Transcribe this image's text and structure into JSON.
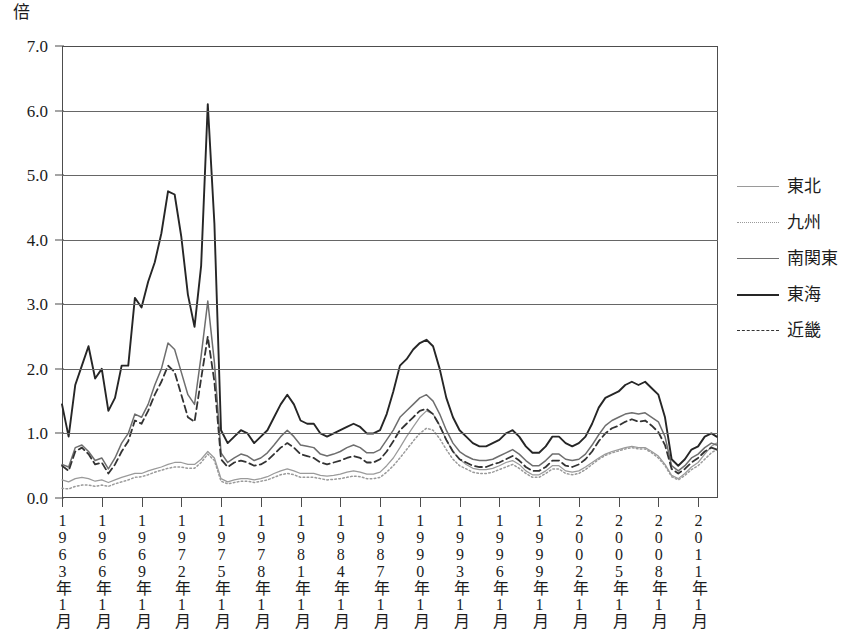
{
  "unit_label": "倍",
  "axes": {
    "y_ticks": [
      "7.0",
      "6.0",
      "5.0",
      "4.0",
      "3.0",
      "2.0",
      "1.0",
      "0.0"
    ],
    "x_ticks": [
      "1963年1月",
      "1966年1月",
      "1969年1月",
      "1972年1月",
      "1975年1月",
      "1978年1月",
      "1981年1月",
      "1984年1月",
      "1987年1月",
      "1990年1月",
      "1993年1月",
      "1996年1月",
      "1999年1月",
      "2002年1月",
      "2005年1月",
      "2008年1月",
      "2011年1月"
    ]
  },
  "legend": {
    "items": [
      {
        "label": "東北",
        "key": "tohoku",
        "style": "thin-solid-gray",
        "color": "#9a9a9a"
      },
      {
        "label": "九州",
        "key": "kyushu",
        "style": "dotted-gray",
        "color": "#9a9a9a"
      },
      {
        "label": "南関東",
        "key": "minamikanto",
        "style": "solid-gray",
        "color": "#6e6e6e"
      },
      {
        "label": "東海",
        "key": "tokai",
        "style": "thick-solid-black",
        "color": "#262626"
      },
      {
        "label": "近畿",
        "key": "kinki",
        "style": "dashed-black",
        "color": "#333333"
      }
    ]
  },
  "chart_data": {
    "type": "line",
    "title": "",
    "xlabel": "",
    "ylabel": "倍",
    "ylim": [
      0,
      7
    ],
    "xlim": [
      1963,
      2012.5
    ],
    "grid": true,
    "legend_position": "right",
    "x_tick_values": [
      1963,
      1966,
      1969,
      1972,
      1975,
      1978,
      1981,
      1984,
      1987,
      1990,
      1993,
      1996,
      1999,
      2002,
      2005,
      2008,
      2011
    ],
    "y_tick_values": [
      0,
      1,
      2,
      3,
      4,
      5,
      6,
      7
    ],
    "x_unit": "year (January of labeled year)",
    "x": [
      1963.0,
      1963.5,
      1964.0,
      1964.5,
      1965.0,
      1965.5,
      1966.0,
      1966.5,
      1967.0,
      1967.5,
      1968.0,
      1968.5,
      1969.0,
      1969.5,
      1970.0,
      1970.5,
      1971.0,
      1971.5,
      1972.0,
      1972.5,
      1973.0,
      1973.5,
      1974.0,
      1974.5,
      1975.0,
      1975.5,
      1976.0,
      1976.5,
      1977.0,
      1977.5,
      1978.0,
      1978.5,
      1979.0,
      1979.5,
      1980.0,
      1980.5,
      1981.0,
      1981.5,
      1982.0,
      1982.5,
      1983.0,
      1983.5,
      1984.0,
      1984.5,
      1985.0,
      1985.5,
      1986.0,
      1986.5,
      1987.0,
      1987.5,
      1988.0,
      1988.5,
      1989.0,
      1989.5,
      1990.0,
      1990.5,
      1991.0,
      1991.5,
      1992.0,
      1992.5,
      1993.0,
      1993.5,
      1994.0,
      1994.5,
      1995.0,
      1995.5,
      1996.0,
      1996.5,
      1997.0,
      1997.5,
      1998.0,
      1998.5,
      1999.0,
      1999.5,
      2000.0,
      2000.5,
      2001.0,
      2001.5,
      2002.0,
      2002.5,
      2003.0,
      2003.5,
      2004.0,
      2004.5,
      2005.0,
      2005.5,
      2006.0,
      2006.5,
      2007.0,
      2007.5,
      2008.0,
      2008.5,
      2009.0,
      2009.5,
      2010.0,
      2010.5,
      2011.0,
      2011.5,
      2012.0,
      2012.4
    ],
    "series": [
      {
        "name": "東海",
        "key": "tokai",
        "style": "thick-solid-black",
        "color": "#262626",
        "values": [
          1.45,
          0.95,
          1.75,
          2.05,
          2.35,
          1.85,
          2.0,
          1.35,
          1.55,
          2.05,
          2.05,
          3.1,
          2.95,
          3.35,
          3.65,
          4.1,
          4.75,
          4.7,
          4.05,
          3.15,
          2.65,
          3.6,
          6.1,
          4.25,
          1.05,
          0.85,
          0.95,
          1.05,
          1.0,
          0.85,
          0.95,
          1.05,
          1.25,
          1.45,
          1.6,
          1.45,
          1.2,
          1.15,
          1.15,
          1.0,
          0.95,
          1.0,
          1.05,
          1.1,
          1.15,
          1.1,
          1.0,
          1.0,
          1.05,
          1.3,
          1.65,
          2.05,
          2.15,
          2.3,
          2.4,
          2.45,
          2.35,
          2.0,
          1.55,
          1.25,
          1.05,
          0.95,
          0.85,
          0.8,
          0.8,
          0.85,
          0.9,
          1.0,
          1.05,
          0.95,
          0.8,
          0.7,
          0.7,
          0.8,
          0.95,
          0.95,
          0.85,
          0.8,
          0.85,
          0.95,
          1.15,
          1.4,
          1.55,
          1.6,
          1.65,
          1.75,
          1.8,
          1.75,
          1.8,
          1.7,
          1.6,
          1.25,
          0.6,
          0.5,
          0.6,
          0.75,
          0.8,
          0.95,
          1.0,
          0.95
        ]
      },
      {
        "name": "南関東",
        "key": "minamikanto",
        "style": "solid-gray",
        "color": "#6e6e6e",
        "values": [
          0.52,
          0.48,
          0.78,
          0.82,
          0.72,
          0.58,
          0.62,
          0.45,
          0.62,
          0.85,
          1.0,
          1.3,
          1.25,
          1.45,
          1.75,
          2.0,
          2.4,
          2.3,
          1.95,
          1.6,
          1.45,
          2.2,
          3.05,
          2.1,
          0.7,
          0.55,
          0.62,
          0.68,
          0.65,
          0.58,
          0.62,
          0.7,
          0.82,
          0.95,
          1.05,
          0.95,
          0.82,
          0.8,
          0.78,
          0.68,
          0.65,
          0.68,
          0.72,
          0.78,
          0.82,
          0.78,
          0.7,
          0.7,
          0.75,
          0.9,
          1.05,
          1.25,
          1.35,
          1.45,
          1.55,
          1.6,
          1.5,
          1.3,
          1.05,
          0.85,
          0.72,
          0.65,
          0.6,
          0.58,
          0.58,
          0.6,
          0.65,
          0.7,
          0.75,
          0.68,
          0.58,
          0.5,
          0.5,
          0.58,
          0.68,
          0.68,
          0.6,
          0.58,
          0.6,
          0.68,
          0.82,
          0.98,
          1.12,
          1.2,
          1.25,
          1.3,
          1.32,
          1.3,
          1.32,
          1.25,
          1.18,
          0.95,
          0.5,
          0.42,
          0.5,
          0.62,
          0.68,
          0.78,
          0.85,
          0.82
        ]
      },
      {
        "name": "近畿",
        "key": "kinki",
        "style": "dashed-black",
        "color": "#333333",
        "values": [
          0.5,
          0.42,
          0.72,
          0.78,
          0.68,
          0.52,
          0.55,
          0.38,
          0.52,
          0.72,
          0.88,
          1.2,
          1.15,
          1.35,
          1.6,
          1.8,
          2.05,
          1.95,
          1.6,
          1.25,
          1.18,
          1.85,
          2.5,
          1.8,
          0.6,
          0.48,
          0.55,
          0.58,
          0.55,
          0.5,
          0.52,
          0.58,
          0.68,
          0.78,
          0.85,
          0.78,
          0.68,
          0.65,
          0.62,
          0.55,
          0.52,
          0.55,
          0.58,
          0.62,
          0.65,
          0.62,
          0.55,
          0.55,
          0.6,
          0.72,
          0.88,
          1.05,
          1.15,
          1.25,
          1.35,
          1.38,
          1.3,
          1.12,
          0.9,
          0.72,
          0.6,
          0.55,
          0.5,
          0.48,
          0.48,
          0.52,
          0.55,
          0.6,
          0.65,
          0.58,
          0.48,
          0.42,
          0.42,
          0.48,
          0.58,
          0.58,
          0.5,
          0.48,
          0.52,
          0.6,
          0.72,
          0.88,
          1.0,
          1.08,
          1.12,
          1.18,
          1.22,
          1.18,
          1.2,
          1.12,
          1.02,
          0.82,
          0.45,
          0.38,
          0.45,
          0.55,
          0.62,
          0.72,
          0.78,
          0.75
        ]
      },
      {
        "name": "東北",
        "key": "tohoku",
        "style": "thin-solid-gray",
        "color": "#9a9a9a",
        "values": [
          0.28,
          0.25,
          0.3,
          0.32,
          0.3,
          0.26,
          0.28,
          0.24,
          0.28,
          0.32,
          0.35,
          0.38,
          0.38,
          0.42,
          0.45,
          0.48,
          0.52,
          0.55,
          0.55,
          0.52,
          0.52,
          0.6,
          0.72,
          0.62,
          0.3,
          0.25,
          0.28,
          0.3,
          0.3,
          0.28,
          0.3,
          0.33,
          0.38,
          0.42,
          0.45,
          0.42,
          0.38,
          0.38,
          0.38,
          0.35,
          0.34,
          0.35,
          0.37,
          0.4,
          0.42,
          0.4,
          0.37,
          0.37,
          0.4,
          0.5,
          0.62,
          0.78,
          0.95,
          1.1,
          1.25,
          1.35,
          1.3,
          1.12,
          0.9,
          0.72,
          0.6,
          0.52,
          0.46,
          0.44,
          0.44,
          0.46,
          0.5,
          0.55,
          0.58,
          0.52,
          0.42,
          0.36,
          0.36,
          0.42,
          0.5,
          0.5,
          0.42,
          0.4,
          0.42,
          0.48,
          0.55,
          0.62,
          0.68,
          0.72,
          0.75,
          0.78,
          0.8,
          0.78,
          0.78,
          0.72,
          0.65,
          0.52,
          0.35,
          0.3,
          0.38,
          0.48,
          0.55,
          0.68,
          0.8,
          0.85
        ]
      },
      {
        "name": "九州",
        "key": "kyushu",
        "style": "dotted-gray",
        "color": "#9a9a9a",
        "values": [
          0.15,
          0.14,
          0.18,
          0.2,
          0.2,
          0.18,
          0.2,
          0.18,
          0.22,
          0.25,
          0.28,
          0.32,
          0.33,
          0.36,
          0.4,
          0.43,
          0.46,
          0.48,
          0.48,
          0.46,
          0.46,
          0.55,
          0.68,
          0.58,
          0.26,
          0.22,
          0.24,
          0.26,
          0.26,
          0.24,
          0.26,
          0.28,
          0.32,
          0.36,
          0.38,
          0.36,
          0.32,
          0.32,
          0.32,
          0.3,
          0.28,
          0.29,
          0.3,
          0.32,
          0.34,
          0.33,
          0.3,
          0.3,
          0.32,
          0.4,
          0.5,
          0.62,
          0.75,
          0.88,
          1.0,
          1.08,
          1.05,
          0.92,
          0.75,
          0.6,
          0.5,
          0.45,
          0.4,
          0.38,
          0.38,
          0.4,
          0.44,
          0.48,
          0.52,
          0.46,
          0.38,
          0.32,
          0.32,
          0.38,
          0.45,
          0.45,
          0.38,
          0.36,
          0.38,
          0.44,
          0.52,
          0.6,
          0.66,
          0.7,
          0.73,
          0.76,
          0.78,
          0.76,
          0.76,
          0.7,
          0.62,
          0.5,
          0.33,
          0.28,
          0.35,
          0.44,
          0.5,
          0.6,
          0.7,
          0.75
        ]
      }
    ]
  }
}
